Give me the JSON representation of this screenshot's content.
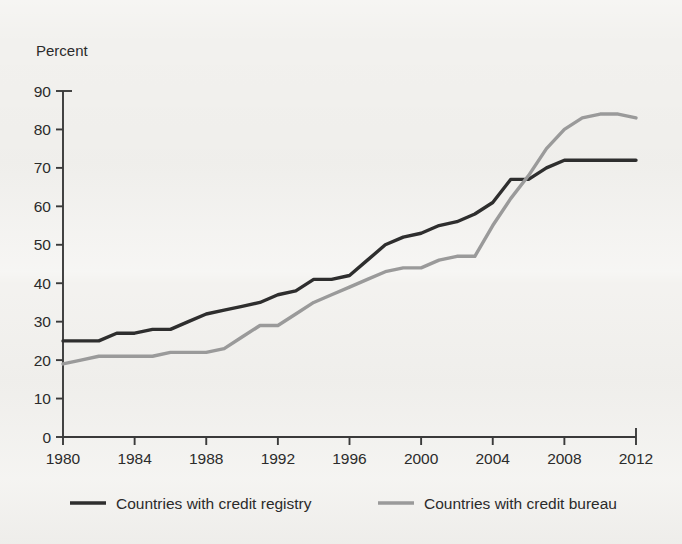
{
  "figure": {
    "background_color": "#f2f1ee",
    "axis_color": "#3a3a3a",
    "text_color": "#2b2b2b"
  },
  "chart_data": {
    "type": "line",
    "title": "",
    "subtitle": "",
    "xlabel": "",
    "ylabel": "Percent",
    "ylabel_position": "top-left",
    "xlim": [
      1980,
      2012
    ],
    "ylim": [
      0,
      90
    ],
    "y_ticks": [
      0,
      10,
      20,
      30,
      40,
      50,
      60,
      70,
      80,
      90
    ],
    "x_ticks": [
      1980,
      1984,
      1988,
      1992,
      1996,
      2000,
      2004,
      2008,
      2012
    ],
    "x_tick_labels": [
      "1980",
      "1984",
      "1988",
      "1992",
      "1996",
      "2000",
      "2004",
      "2008",
      "2012"
    ],
    "y_tick_labels": [
      "0",
      "10",
      "20",
      "30",
      "40",
      "50",
      "60",
      "70",
      "80",
      "90"
    ],
    "grid": false,
    "legend_position": "bottom",
    "x": [
      1980,
      1981,
      1982,
      1983,
      1984,
      1985,
      1986,
      1987,
      1988,
      1989,
      1990,
      1991,
      1992,
      1993,
      1994,
      1995,
      1996,
      1997,
      1998,
      1999,
      2000,
      2001,
      2002,
      2003,
      2004,
      2005,
      2006,
      2007,
      2008,
      2009,
      2010,
      2011,
      2012
    ],
    "series": [
      {
        "name": "Countries with credit registry",
        "color": "#2e2e2e",
        "line_width": 3.4,
        "values": [
          25,
          25,
          25,
          27,
          27,
          28,
          28,
          30,
          32,
          33,
          34,
          35,
          37,
          38,
          41,
          41,
          42,
          46,
          50,
          52,
          53,
          55,
          56,
          58,
          61,
          67,
          67,
          70,
          72,
          72,
          72,
          72,
          72
        ]
      },
      {
        "name": "Countries with credit bureau",
        "color": "#9a9a9a",
        "line_width": 3.4,
        "values": [
          19,
          20,
          21,
          21,
          21,
          21,
          22,
          22,
          22,
          23,
          26,
          29,
          29,
          32,
          35,
          37,
          39,
          41,
          43,
          44,
          44,
          46,
          47,
          47,
          55,
          62,
          68,
          75,
          80,
          83,
          84,
          84,
          83
        ]
      }
    ]
  },
  "legend": {
    "items": [
      {
        "label": "Countries with credit registry",
        "color": "#2e2e2e"
      },
      {
        "label": "Countries with credit bureau",
        "color": "#9a9a9a"
      }
    ]
  }
}
